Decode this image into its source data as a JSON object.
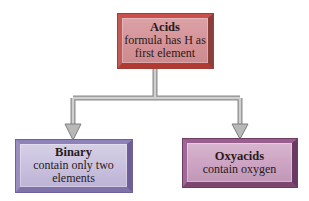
{
  "diagram": {
    "type": "hierarchy",
    "root": {
      "title": "Acids",
      "lines": [
        "formula has H as",
        "first element"
      ],
      "color": "#d4959a"
    },
    "children": [
      {
        "title": "Binary",
        "lines": [
          "contain only two",
          "elements"
        ],
        "color": "#c8c0de"
      },
      {
        "title": "Oxyacids",
        "lines": [
          "contain oxygen"
        ],
        "color": "#cca3c2"
      }
    ],
    "connector_color": "#9a9a9a"
  }
}
